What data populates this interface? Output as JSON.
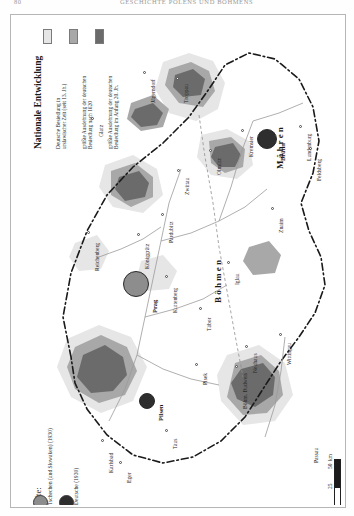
{
  "header": {
    "folio_left": "80",
    "folio_right": "GESCHICHTE POLENS UND BÖHMENS"
  },
  "legend_national": {
    "title": "Nationale Entwicklung",
    "entries": [
      {
        "color": "#e2e2e2",
        "label": "Deutsche Besiedlung in\nurslawischer Zeit (seit 13. Jh.)"
      },
      {
        "color": "#9e9e9e",
        "label": "größte Ausdehnung der deutschen\nBesiedlung nach 1620"
      },
      {
        "color": "#5a5a5a",
        "label": "größte Ausdehnung der deutschen\nBesiedlung im Anfang 20. Jh."
      }
    ]
  },
  "legend_cities": {
    "title": "Städte:",
    "entries": [
      {
        "swatch": "pie-cz",
        "label": "Tschechen (und Slowaken) (1930)"
      },
      {
        "swatch": "pie-de",
        "label": "Deutsche (1930)"
      }
    ]
  },
  "scale": {
    "ticks": [
      "0",
      "25",
      "50"
    ],
    "unit": "km"
  },
  "regions": [
    {
      "name": "Böhmen",
      "label": "Böhmen"
    },
    {
      "name": "Mähren",
      "label": "Mähren"
    }
  ],
  "places": [
    {
      "label": "Troppau"
    },
    {
      "label": "Jägerndorf"
    },
    {
      "label": "Glatz"
    },
    {
      "label": "Olmütz"
    },
    {
      "label": "Kremsier"
    },
    {
      "label": "Brünn"
    },
    {
      "label": "Lundenburg"
    },
    {
      "label": "Feldsberg"
    },
    {
      "label": "Zwittau"
    },
    {
      "label": "Pardubitz"
    },
    {
      "label": "Königgrätz"
    },
    {
      "label": "Reichenberg"
    },
    {
      "label": "Prag"
    },
    {
      "label": "Kuttenberg"
    },
    {
      "label": "Iglau"
    },
    {
      "label": "Znaim"
    },
    {
      "label": "Tábor"
    },
    {
      "label": "Neuhaus"
    },
    {
      "label": "Wittingau"
    },
    {
      "label": "Böhm. Budweis"
    },
    {
      "label": "Pisek"
    },
    {
      "label": "Pilsen"
    },
    {
      "label": "Taus"
    },
    {
      "label": "Karlsbad"
    },
    {
      "label": "Eger"
    },
    {
      "label": "Passau"
    }
  ]
}
